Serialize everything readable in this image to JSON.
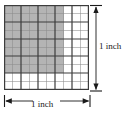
{
  "figure": {
    "grid": {
      "columns": 10,
      "rows": 10,
      "minor_line_color": "#8c8c8c",
      "major_line_color": "#3c3c3c",
      "major_line_every": 2,
      "border_color": "#3c3c3c",
      "cell_fill_unshaded": "#ffffff"
    },
    "shaded": {
      "columns": 7,
      "rows": 8,
      "fill_color": "#b4b4b4",
      "fraction_label": "",
      "cell_count": 56
    },
    "dimensions": {
      "right_label": "1 inch",
      "bottom_label": "1 inch",
      "arrow_color": "#1a1a1a"
    }
  }
}
